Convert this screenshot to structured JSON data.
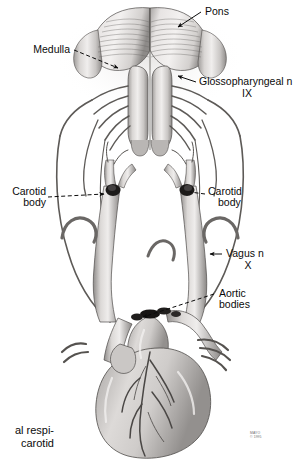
{
  "figure": {
    "style": "grayscale medical line-and-wash illustration",
    "background": "#ffffff",
    "ink": "#0b0b0b",
    "tissue_light": "#e4e2e1",
    "tissue_mid": "#bdbab8",
    "tissue_dark": "#8a8785",
    "tissue_shadow": "#5d5a58"
  },
  "labels": {
    "pons": "Pons",
    "medulla": "Medulla",
    "glossopharyngeal_line1": "Glossopharyngeal n",
    "glossopharyngeal_line2": "IX",
    "carotid_body_left_line1": "Carotid",
    "carotid_body_left_line2": "body",
    "carotid_body_right_line1": "Carotid",
    "carotid_body_right_line2": "body",
    "vagus_line1": "Vagus n",
    "vagus_line2": "X",
    "aortic_bodies_line1": "Aortic",
    "aortic_bodies_line2": "bodies"
  },
  "caption": {
    "line1": "al respi-",
    "line2": "carotid"
  },
  "watermark": {
    "line1": "MAYO",
    "line2": "© 1995"
  }
}
